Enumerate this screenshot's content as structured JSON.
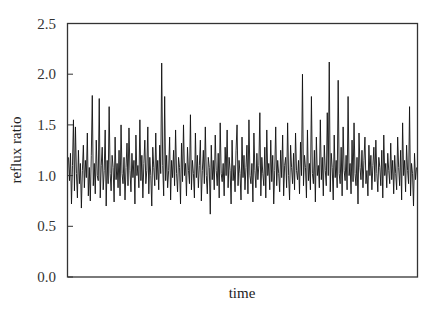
{
  "chart_data": {
    "type": "line",
    "title": "",
    "xlabel": "time",
    "ylabel": "reflux ratio",
    "ylim": [
      0.0,
      2.5
    ],
    "yticks": [
      0.0,
      0.5,
      1.0,
      1.5,
      2.0,
      2.5
    ],
    "ytick_labels": [
      "0.0",
      "0.5",
      "1.0",
      "1.5",
      "2.0",
      "2.5"
    ],
    "xticks": [],
    "grid": false,
    "legend": null,
    "series": [
      {
        "name": "reflux ratio",
        "color": "#111111",
        "approx_mean": 1.07,
        "values": [
          1.18,
          0.95,
          1.22,
          0.72,
          1.1,
          1.55,
          0.85,
          1.48,
          1.02,
          0.78,
          1.25,
          0.92,
          1.12,
          0.68,
          1.05,
          1.3,
          0.88,
          1.15,
          0.98,
          1.42,
          0.8,
          1.08,
          0.75,
          1.2,
          1.79,
          0.9,
          1.12,
          0.82,
          1.35,
          1.0,
          0.95,
          1.76,
          0.78,
          1.1,
          1.28,
          0.86,
          1.05,
          1.45,
          0.7,
          1.15,
          0.92,
          1.68,
          1.02,
          0.85,
          1.2,
          1.08,
          0.74,
          1.38,
          0.96,
          1.12,
          0.88,
          1.25,
          0.8,
          1.5,
          1.02,
          0.92,
          1.18,
          0.76,
          1.08,
          1.32,
          0.9,
          1.47,
          1.05,
          0.84,
          1.22,
          0.98,
          1.15,
          0.72,
          1.4,
          1.0,
          1.1,
          0.88,
          1.55,
          0.95,
          1.2,
          0.78,
          1.12,
          1.35,
          0.92,
          1.05,
          1.48,
          0.82,
          1.18,
          1.0,
          0.7,
          1.28,
          1.08,
          0.9,
          1.42,
          0.96,
          1.15,
          0.86,
          1.3,
          1.02,
          2.11,
          1.1,
          0.8,
          1.78,
          0.95,
          1.2,
          0.88,
          1.05,
          1.38,
          0.76,
          1.15,
          0.98,
          1.25,
          0.9,
          1.45,
          1.02,
          0.84,
          1.18,
          1.08,
          0.72,
          1.32,
          0.94,
          1.5,
          1.0,
          1.12,
          0.8,
          1.28,
          1.05,
          0.92,
          1.6,
          0.86,
          1.15,
          1.02,
          0.78,
          1.42,
          0.98,
          1.2,
          0.88,
          1.1,
          1.35,
          0.75,
          1.05,
          1.25,
          0.92,
          1.48,
          1.0,
          0.82,
          1.18,
          1.08,
          0.62,
          1.3,
          0.96,
          1.15,
          0.86,
          1.4,
          1.05,
          0.9,
          1.22,
          0.78,
          1.52,
          1.02,
          0.94,
          1.12,
          0.8,
          1.28,
          1.0,
          1.45,
          0.88,
          1.18,
          1.05,
          0.72,
          1.35,
          0.95,
          1.1,
          0.84,
          1.25,
          1.5,
          0.9,
          1.15,
          1.02,
          0.76,
          1.38,
          0.98,
          1.2,
          0.86,
          1.08,
          1.3,
          0.82,
          1.55,
          1.0,
          0.92,
          1.12,
          0.74,
          1.42,
          1.05,
          0.88,
          1.22,
          0.96,
          1.1,
          1.62,
          0.8,
          1.18,
          1.02,
          0.9,
          1.28,
          0.78,
          1.45,
          1.0,
          1.12,
          0.86,
          1.35,
          0.94,
          1.2,
          0.72,
          1.05,
          1.48,
          0.9,
          1.15,
          1.02,
          0.84,
          1.25,
          0.98,
          1.4,
          0.8,
          1.1,
          1.18,
          0.88,
          1.52,
          1.0,
          0.76,
          1.3,
          1.08,
          0.92,
          1.22,
          0.86,
          1.42,
          1.05,
          0.96,
          1.15,
          0.82,
          1.33,
          1.0,
          2.0,
          0.9,
          1.2,
          1.08,
          0.78,
          1.45,
          0.95,
          1.12,
          0.86,
          1.78,
          1.02,
          0.92,
          1.25,
          0.74,
          1.38,
          1.0,
          1.1,
          0.88,
          1.55,
          0.96,
          1.18,
          0.8,
          1.3,
          1.05,
          0.9,
          1.62,
          1.0,
          2.12,
          0.84,
          1.22,
          1.08,
          0.76,
          1.4,
          0.98,
          1.15,
          0.88,
          1.94,
          1.02,
          0.92,
          1.28,
          0.8,
          1.48,
          1.05,
          0.95,
          1.2,
          0.86,
          1.78,
          1.0,
          1.12,
          0.82,
          1.35,
          0.94,
          1.52,
          1.02,
          0.9,
          1.18,
          0.72,
          1.42,
          1.08,
          0.96,
          1.25,
          0.88,
          1.15,
          1.38,
          0.92,
          1.05,
          0.8,
          1.3,
          1.0,
          1.2,
          0.86,
          1.1,
          1.28,
          0.94,
          1.35,
          1.02,
          0.84,
          1.18,
          1.08,
          0.9,
          1.25,
          0.78,
          1.4,
          1.0,
          1.12,
          0.88,
          1.22,
          1.05,
          0.92,
          1.32,
          0.96,
          1.15,
          0.82,
          1.2,
          1.02,
          0.86,
          1.38,
          1.08,
          0.9,
          1.25,
          0.76,
          1.52,
          1.0,
          1.15,
          0.84,
          1.3,
          1.05,
          0.92,
          1.68,
          0.8,
          1.12,
          1.02,
          0.7,
          1.22,
          0.96,
          1.08
        ]
      }
    ],
    "notable_points": [
      {
        "description": "highest spike",
        "x_fraction": 0.76,
        "y": 2.12
      },
      {
        "description": "spike",
        "x_fraction": 0.38,
        "y": 2.11
      },
      {
        "description": "spike",
        "x_fraction": 0.68,
        "y": 2.0
      },
      {
        "description": "lowest dip",
        "x_fraction": 0.56,
        "y": 0.6
      }
    ]
  }
}
